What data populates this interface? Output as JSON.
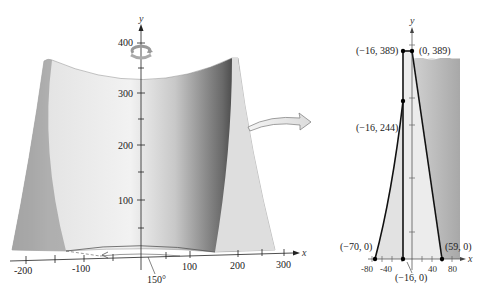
{
  "left_figure": {
    "description": "Solid of revolution (hyperbolic-like surface) rotated about y-axis",
    "axes": {
      "x_label": "x",
      "y_label": "y",
      "x_ticks": [
        "-200",
        "-100",
        "100",
        "200",
        "300"
      ],
      "y_ticks": [
        "100",
        "200",
        "300",
        "400"
      ]
    },
    "angle_label": "150°",
    "rotation_icon": "rotation-arrow-icon"
  },
  "right_figure": {
    "description": "Cross-section region bounded by curve and lines",
    "axes": {
      "x_label": "x",
      "y_label": "y",
      "x_ticks": [
        "-80",
        "-40",
        "40",
        "80"
      ]
    },
    "points": [
      {
        "label": "(−16, 389)",
        "x": -16,
        "y": 389
      },
      {
        "label": "(0, 389)",
        "x": 0,
        "y": 389
      },
      {
        "label": "(−16, 244)",
        "x": -16,
        "y": 244
      },
      {
        "label": "(−70, 0)",
        "x": -70,
        "y": 0
      },
      {
        "label": "(−16, 0)",
        "x": -16,
        "y": 0
      },
      {
        "label": "(59, 0)",
        "x": 59,
        "y": 0
      }
    ]
  },
  "connector_arrow": "curved-arrow-icon"
}
